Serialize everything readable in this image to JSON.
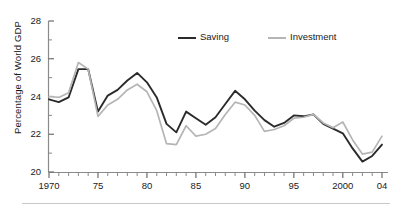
{
  "chart_data": {
    "type": "line",
    "title": "",
    "xlabel": "",
    "ylabel": "Percentage of World GDP",
    "xlim": [
      1970,
      2004
    ],
    "ylim": [
      20,
      28
    ],
    "ytick_values": [
      20,
      22,
      24,
      26,
      28
    ],
    "ytick_labels": [
      "20",
      "22",
      "24",
      "26",
      "28"
    ],
    "yminor_step": 1,
    "xtick_values": [
      1970,
      1975,
      1980,
      1985,
      1990,
      1995,
      2000,
      2004
    ],
    "xtick_labels": [
      "1970",
      "75",
      "80",
      "85",
      "90",
      "95",
      "2000",
      "04"
    ],
    "xminor_step": 1,
    "grid": false,
    "legend_position": "top-center",
    "x": [
      1970,
      1971,
      1972,
      1973,
      1974,
      1975,
      1976,
      1977,
      1978,
      1979,
      1980,
      1981,
      1982,
      1983,
      1984,
      1985,
      1986,
      1987,
      1988,
      1989,
      1990,
      1991,
      1992,
      1993,
      1994,
      1995,
      1996,
      1997,
      1998,
      1999,
      2000,
      2001,
      2002,
      2003,
      2004
    ],
    "series": [
      {
        "name": "Saving",
        "color": "#2b2b2b",
        "values": [
          23.85,
          23.7,
          23.95,
          25.45,
          25.45,
          23.2,
          24.05,
          24.35,
          24.85,
          25.25,
          24.75,
          23.95,
          22.55,
          22.1,
          23.2,
          22.85,
          22.5,
          22.9,
          23.6,
          24.3,
          23.85,
          23.25,
          22.75,
          22.4,
          22.6,
          23.0,
          22.95,
          23.05,
          22.55,
          22.3,
          22.05,
          21.25,
          20.55,
          20.85,
          21.45
        ]
      },
      {
        "name": "Investment",
        "color": "#b5b5b5",
        "values": [
          24.0,
          23.95,
          24.2,
          25.8,
          25.45,
          22.95,
          23.55,
          23.85,
          24.35,
          24.65,
          24.25,
          23.25,
          21.5,
          21.45,
          22.45,
          21.9,
          22.0,
          22.3,
          23.05,
          23.7,
          23.55,
          23.0,
          22.15,
          22.25,
          22.45,
          22.85,
          22.9,
          23.05,
          22.6,
          22.35,
          22.65,
          21.7,
          20.95,
          21.05,
          21.9
        ]
      }
    ]
  },
  "legend": {
    "items": [
      {
        "label": "Saving",
        "color": "#2b2b2b"
      },
      {
        "label": "Investment",
        "color": "#b5b5b5"
      }
    ]
  },
  "axes": {
    "y_axis_title": "Percentage of World GDP"
  }
}
